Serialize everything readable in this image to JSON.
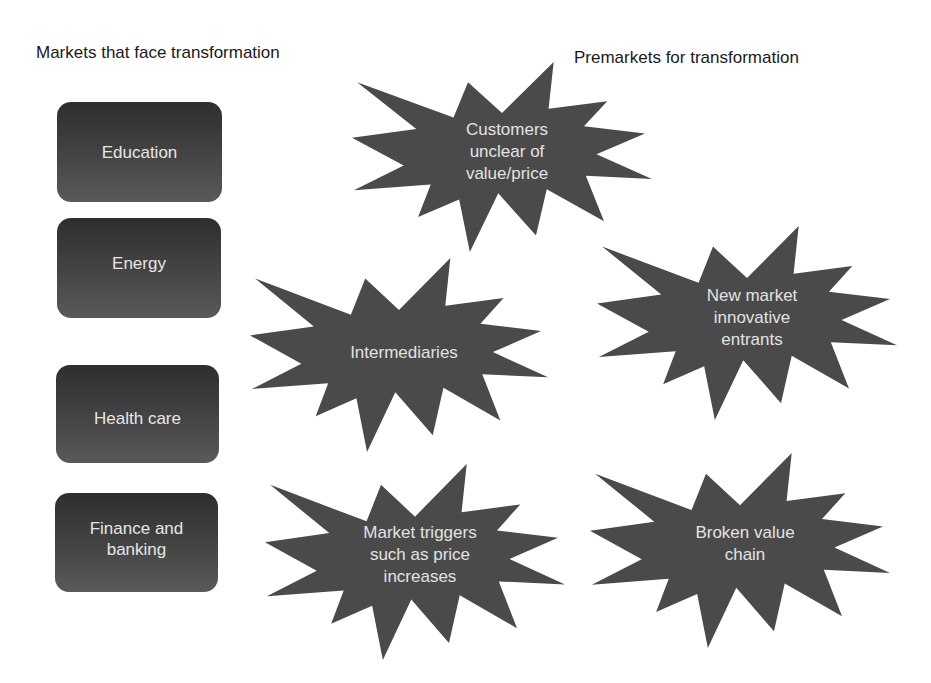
{
  "headings": {
    "left": "Markets that face transformation",
    "right": "Premarkets for transformation"
  },
  "markets": [
    {
      "label": "Education"
    },
    {
      "label": "Energy"
    },
    {
      "label": "Health care"
    },
    {
      "label": "Finance and\nbanking"
    }
  ],
  "premarkets": [
    {
      "label": "Customers\nunclear of\nvalue/price"
    },
    {
      "label": "Intermediaries"
    },
    {
      "label": "New market\ninnovative\nentrants"
    },
    {
      "label": "Market triggers\nsuch as price\nincreases"
    },
    {
      "label": "Broken value\nchain"
    }
  ],
  "colors": {
    "box_fill_top": "#2e2e2e",
    "box_fill_bottom": "#5a5a5a",
    "burst_fill": "#4a4a4a",
    "label_text": "#e6e6e6",
    "heading_text": "#1a1a1a"
  }
}
